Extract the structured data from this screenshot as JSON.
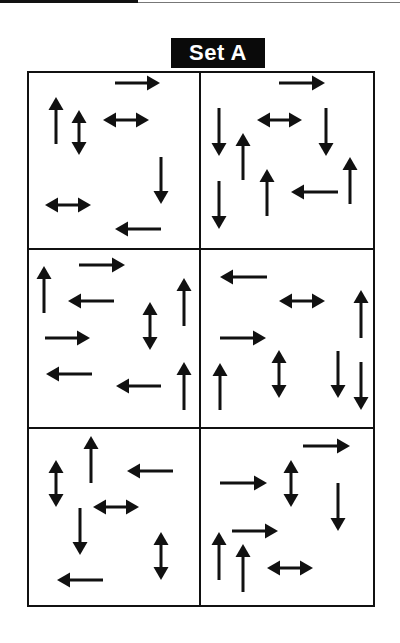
{
  "title": "Set A",
  "colors": {
    "ink": "#111111",
    "background": "#ffffff",
    "title_bg": "#0a0a0a",
    "title_text": "#ffffff"
  },
  "grid": {
    "rows": 3,
    "cols": 2,
    "left": 28,
    "right": 374,
    "top": 72,
    "bottom": 606,
    "col_divider": 200,
    "row_dividers": [
      249,
      428
    ]
  },
  "panels": [
    {
      "id": "r1c1",
      "arrows": [
        {
          "type": "right",
          "x1": 115,
          "y1": 83,
          "x2": 160,
          "y2": 83
        },
        {
          "type": "up",
          "x1": 56,
          "y1": 144,
          "x2": 56,
          "y2": 97
        },
        {
          "type": "double-v",
          "x1": 79,
          "y1": 110,
          "x2": 79,
          "y2": 155
        },
        {
          "type": "double-h",
          "x1": 103,
          "y1": 120,
          "x2": 149,
          "y2": 120
        },
        {
          "type": "down",
          "x1": 161,
          "y1": 157,
          "x2": 161,
          "y2": 204
        },
        {
          "type": "double-h",
          "x1": 45,
          "y1": 205,
          "x2": 91,
          "y2": 205
        },
        {
          "type": "left",
          "x1": 161,
          "y1": 229,
          "x2": 115,
          "y2": 229
        }
      ]
    },
    {
      "id": "r1c2",
      "arrows": [
        {
          "type": "right",
          "x1": 279,
          "y1": 83,
          "x2": 325,
          "y2": 83
        },
        {
          "type": "down",
          "x1": 219,
          "y1": 108,
          "x2": 219,
          "y2": 156
        },
        {
          "type": "double-h",
          "x1": 257,
          "y1": 120,
          "x2": 302,
          "y2": 120
        },
        {
          "type": "down",
          "x1": 326,
          "y1": 108,
          "x2": 326,
          "y2": 156
        },
        {
          "type": "up",
          "x1": 243,
          "y1": 180,
          "x2": 243,
          "y2": 133
        },
        {
          "type": "up",
          "x1": 350,
          "y1": 204,
          "x2": 350,
          "y2": 157
        },
        {
          "type": "up",
          "x1": 267,
          "y1": 216,
          "x2": 267,
          "y2": 169
        },
        {
          "type": "left",
          "x1": 338,
          "y1": 192,
          "x2": 291,
          "y2": 192
        },
        {
          "type": "down",
          "x1": 219,
          "y1": 181,
          "x2": 219,
          "y2": 229
        }
      ]
    },
    {
      "id": "r2c1",
      "arrows": [
        {
          "type": "right",
          "x1": 79,
          "y1": 265,
          "x2": 125,
          "y2": 265
        },
        {
          "type": "up",
          "x1": 44,
          "y1": 313,
          "x2": 44,
          "y2": 266
        },
        {
          "type": "left",
          "x1": 114,
          "y1": 301,
          "x2": 68,
          "y2": 301
        },
        {
          "type": "up",
          "x1": 184,
          "y1": 326,
          "x2": 184,
          "y2": 278
        },
        {
          "type": "double-v",
          "x1": 150,
          "y1": 302,
          "x2": 150,
          "y2": 350
        },
        {
          "type": "right",
          "x1": 45,
          "y1": 338,
          "x2": 90,
          "y2": 338
        },
        {
          "type": "left",
          "x1": 92,
          "y1": 374,
          "x2": 46,
          "y2": 374
        },
        {
          "type": "left",
          "x1": 161,
          "y1": 386,
          "x2": 116,
          "y2": 386
        },
        {
          "type": "up",
          "x1": 184,
          "y1": 410,
          "x2": 184,
          "y2": 362
        }
      ]
    },
    {
      "id": "r2c2",
      "arrows": [
        {
          "type": "left",
          "x1": 267,
          "y1": 277,
          "x2": 220,
          "y2": 277
        },
        {
          "type": "double-h",
          "x1": 279,
          "y1": 301,
          "x2": 325,
          "y2": 301
        },
        {
          "type": "up",
          "x1": 361,
          "y1": 338,
          "x2": 361,
          "y2": 290
        },
        {
          "type": "right",
          "x1": 220,
          "y1": 338,
          "x2": 266,
          "y2": 338
        },
        {
          "type": "double-v",
          "x1": 279,
          "y1": 350,
          "x2": 279,
          "y2": 398
        },
        {
          "type": "up",
          "x1": 220,
          "y1": 410,
          "x2": 220,
          "y2": 363
        },
        {
          "type": "down",
          "x1": 338,
          "y1": 351,
          "x2": 338,
          "y2": 398
        },
        {
          "type": "down",
          "x1": 361,
          "y1": 362,
          "x2": 361,
          "y2": 410
        }
      ]
    },
    {
      "id": "r3c1",
      "arrows": [
        {
          "type": "up",
          "x1": 91,
          "y1": 483,
          "x2": 91,
          "y2": 436
        },
        {
          "type": "double-v",
          "x1": 56,
          "y1": 460,
          "x2": 56,
          "y2": 507
        },
        {
          "type": "left",
          "x1": 173,
          "y1": 471,
          "x2": 127,
          "y2": 471
        },
        {
          "type": "double-h",
          "x1": 93,
          "y1": 507,
          "x2": 139,
          "y2": 507
        },
        {
          "type": "down",
          "x1": 80,
          "y1": 508,
          "x2": 80,
          "y2": 555
        },
        {
          "type": "double-v",
          "x1": 161,
          "y1": 532,
          "x2": 161,
          "y2": 580
        },
        {
          "type": "left",
          "x1": 103,
          "y1": 580,
          "x2": 57,
          "y2": 580
        }
      ]
    },
    {
      "id": "r3c2",
      "arrows": [
        {
          "type": "right",
          "x1": 303,
          "y1": 446,
          "x2": 350,
          "y2": 446
        },
        {
          "type": "double-v",
          "x1": 291,
          "y1": 460,
          "x2": 291,
          "y2": 507
        },
        {
          "type": "right",
          "x1": 220,
          "y1": 483,
          "x2": 267,
          "y2": 483
        },
        {
          "type": "down",
          "x1": 338,
          "y1": 483,
          "x2": 338,
          "y2": 531
        },
        {
          "type": "right",
          "x1": 232,
          "y1": 531,
          "x2": 278,
          "y2": 531
        },
        {
          "type": "up",
          "x1": 219,
          "y1": 580,
          "x2": 219,
          "y2": 532
        },
        {
          "type": "up",
          "x1": 243,
          "y1": 592,
          "x2": 243,
          "y2": 544
        },
        {
          "type": "double-h",
          "x1": 267,
          "y1": 568,
          "x2": 313,
          "y2": 568
        }
      ]
    }
  ]
}
